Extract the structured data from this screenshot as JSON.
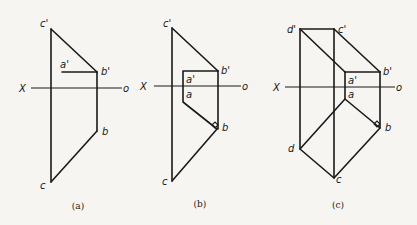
{
  "figure": {
    "panels": [
      {
        "id": "a",
        "caption": "(a)",
        "axis": {
          "left": "X",
          "right": "o"
        },
        "labels": {
          "c_prime": "c'",
          "a_prime": "a'",
          "b_prime": "b'",
          "b": "b",
          "c": "c"
        }
      },
      {
        "id": "b",
        "caption": "(b)",
        "axis": {
          "left": "X",
          "right": "o"
        },
        "labels": {
          "c_prime": "c'",
          "a_prime": "a'",
          "b_prime": "b'",
          "a": "a",
          "b": "b",
          "c": "c"
        }
      },
      {
        "id": "c",
        "caption": "(c)",
        "axis": {
          "left": "X",
          "right": "o"
        },
        "labels": {
          "d_prime": "d'",
          "c_prime": "c'",
          "a_prime": "a'",
          "b_prime": "b'",
          "a": "a",
          "b": "b",
          "c": "c",
          "d": "d"
        }
      }
    ]
  }
}
